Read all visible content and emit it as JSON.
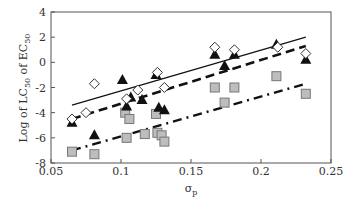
{
  "chart_data": {
    "type": "scatter",
    "title": "",
    "xlabel": "σp",
    "ylabel": "Log of LC50 of EC50",
    "xlim": [
      0.05,
      0.25
    ],
    "ylim": [
      -8,
      4
    ],
    "x_ticks": [
      "0.05",
      "0.1",
      "0.15",
      "0.2",
      "0.25"
    ],
    "y_ticks": [
      "4",
      "2",
      "0",
      "-2",
      "-4",
      "-6",
      "-8"
    ],
    "grid": false,
    "legend": "none",
    "series": [
      {
        "name": "open diamonds",
        "marker": "diamond-open",
        "line_style": "solid",
        "points": [
          {
            "x": 0.065,
            "y": -4.5
          },
          {
            "x": 0.075,
            "y": -4.0
          },
          {
            "x": 0.081,
            "y": -1.7
          },
          {
            "x": 0.104,
            "y": -2.9
          },
          {
            "x": 0.112,
            "y": -2.2
          },
          {
            "x": 0.126,
            "y": -0.8
          },
          {
            "x": 0.131,
            "y": -2.0
          },
          {
            "x": 0.167,
            "y": 1.2
          },
          {
            "x": 0.181,
            "y": 1.0
          },
          {
            "x": 0.212,
            "y": 1.2
          },
          {
            "x": 0.232,
            "y": 0.7
          }
        ],
        "fit_line": {
          "x0": 0.065,
          "y0": -3.4,
          "x1": 0.232,
          "y1": 2.0
        }
      },
      {
        "name": "filled triangles",
        "marker": "triangle-filled",
        "line_style": "dashed",
        "points": [
          {
            "x": 0.065,
            "y": -4.8
          },
          {
            "x": 0.081,
            "y": -5.8
          },
          {
            "x": 0.101,
            "y": -1.4
          },
          {
            "x": 0.104,
            "y": -3.5
          },
          {
            "x": 0.107,
            "y": -2.8
          },
          {
            "x": 0.115,
            "y": -3.0
          },
          {
            "x": 0.125,
            "y": -1.0
          },
          {
            "x": 0.127,
            "y": -3.6
          },
          {
            "x": 0.131,
            "y": -3.8
          },
          {
            "x": 0.167,
            "y": 0.6
          },
          {
            "x": 0.174,
            "y": -0.3
          },
          {
            "x": 0.181,
            "y": 0.6
          },
          {
            "x": 0.211,
            "y": 1.4
          },
          {
            "x": 0.232,
            "y": 0.2
          }
        ],
        "fit_line": {
          "x0": 0.065,
          "y0": -4.5,
          "x1": 0.232,
          "y1": 1.3
        }
      },
      {
        "name": "gray squares",
        "marker": "square-gray",
        "line_style": "dash-dot",
        "points": [
          {
            "x": 0.065,
            "y": -7.1
          },
          {
            "x": 0.081,
            "y": -7.3
          },
          {
            "x": 0.103,
            "y": -4.0
          },
          {
            "x": 0.106,
            "y": -4.5
          },
          {
            "x": 0.104,
            "y": -6.0
          },
          {
            "x": 0.117,
            "y": -5.7
          },
          {
            "x": 0.125,
            "y": -4.1
          },
          {
            "x": 0.126,
            "y": -5.6
          },
          {
            "x": 0.129,
            "y": -5.8
          },
          {
            "x": 0.131,
            "y": -6.3
          },
          {
            "x": 0.167,
            "y": -2.0
          },
          {
            "x": 0.174,
            "y": -3.2
          },
          {
            "x": 0.181,
            "y": -2.0
          },
          {
            "x": 0.211,
            "y": -1.1
          },
          {
            "x": 0.232,
            "y": -2.5
          }
        ],
        "fit_line": {
          "x0": 0.065,
          "y0": -7.0,
          "x1": 0.232,
          "y1": -1.7
        }
      }
    ]
  },
  "axes": {
    "x_label_main": "σ",
    "x_label_sub": "p",
    "y_label_parts": [
      "Log of LC",
      "50",
      " of EC",
      "50"
    ]
  }
}
